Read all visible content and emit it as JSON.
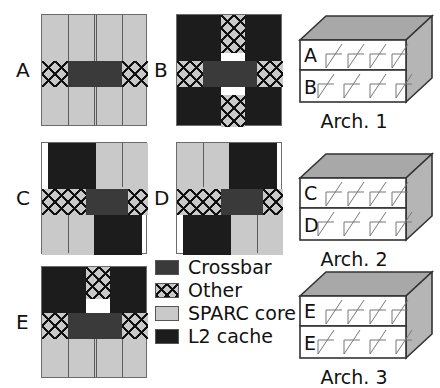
{
  "figure": {
    "panel_labels": [
      "A",
      "B",
      "C",
      "D",
      "E"
    ],
    "architectures": [
      {
        "caption": "Arch. 1",
        "top_layer": "A",
        "bottom_layer": "B"
      },
      {
        "caption": "Arch. 2",
        "top_layer": "C",
        "bottom_layer": "D"
      },
      {
        "caption": "Arch. 3",
        "top_layer": "E",
        "bottom_layer": "E"
      }
    ]
  },
  "legend": {
    "items": [
      {
        "label": "Crossbar",
        "color": "#3a3a3a",
        "pattern": "solid"
      },
      {
        "label": "Other",
        "color": "#c9c9c9",
        "pattern": "crosshatch"
      },
      {
        "label": "SPARC core",
        "color": "#c9c9c9",
        "pattern": "solid"
      },
      {
        "label": "L2 cache",
        "color": "#1c1c1c",
        "pattern": "solid"
      }
    ]
  },
  "floorplans": {
    "A": {
      "label": "A",
      "description": "SPARC core field with horizontal crossbar band and Other blocks at both ends"
    },
    "B": {
      "label": "B",
      "description": "L2 cache field with cross-shaped crossbar and Other strips"
    },
    "C": {
      "label": "C",
      "description": "L2 cache top-left and bottom-right, SPARC core top-right and bottom-left, crossbar band"
    },
    "D": {
      "label": "D",
      "description": "SPARC core top-left and bottom-right, L2 cache top-right and bottom-left, crossbar band"
    },
    "E": {
      "label": "E",
      "description": "L2 cache upper half with Other strip, crossbar band, SPARC core lower half"
    }
  }
}
